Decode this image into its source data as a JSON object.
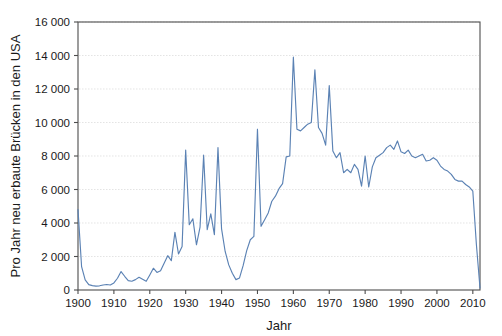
{
  "chart_data": {
    "type": "line",
    "title": "",
    "xlabel": "Jahr",
    "ylabel": "Pro Jahr neu erbaute Brücken in den USA",
    "xlim": [
      1900,
      2012
    ],
    "ylim": [
      0,
      16000
    ],
    "grid": true,
    "legend": "none",
    "line_color": "#5b82b4",
    "xticks": [
      "1900",
      "1910",
      "1920",
      "1930",
      "1940",
      "1950",
      "1960",
      "1970",
      "1980",
      "1990",
      "2000",
      "2010"
    ],
    "xtick_values": [
      1900,
      1910,
      1920,
      1930,
      1940,
      1950,
      1960,
      1970,
      1980,
      1990,
      2000,
      2010
    ],
    "yticks": [
      "0",
      "2 000",
      "4 000",
      "6 000",
      "8 000",
      "10 000",
      "12 000",
      "14 000",
      "16 000"
    ],
    "ytick_values": [
      0,
      2000,
      4000,
      6000,
      8000,
      10000,
      12000,
      14000,
      16000
    ],
    "series": [
      {
        "name": "Pro Jahr neu erbaute Brücken in den USA",
        "x": [
          1900,
          1901,
          1902,
          1903,
          1904,
          1905,
          1906,
          1907,
          1908,
          1909,
          1910,
          1911,
          1912,
          1913,
          1914,
          1915,
          1916,
          1917,
          1918,
          1919,
          1920,
          1921,
          1922,
          1923,
          1924,
          1925,
          1926,
          1927,
          1928,
          1929,
          1930,
          1931,
          1932,
          1933,
          1934,
          1935,
          1936,
          1937,
          1938,
          1939,
          1940,
          1941,
          1942,
          1943,
          1944,
          1945,
          1946,
          1947,
          1948,
          1949,
          1950,
          1951,
          1952,
          1953,
          1954,
          1955,
          1956,
          1957,
          1958,
          1959,
          1960,
          1961,
          1962,
          1963,
          1964,
          1965,
          1966,
          1967,
          1968,
          1969,
          1970,
          1971,
          1972,
          1973,
          1974,
          1975,
          1976,
          1977,
          1978,
          1979,
          1980,
          1981,
          1982,
          1983,
          1984,
          1985,
          1986,
          1987,
          1988,
          1989,
          1990,
          1991,
          1992,
          1993,
          1994,
          1995,
          1996,
          1997,
          1998,
          1999,
          2000,
          2001,
          2002,
          2003,
          2004,
          2005,
          2006,
          2007,
          2008,
          2009,
          2010,
          2011,
          2012
        ],
        "values": [
          4800,
          1400,
          600,
          320,
          260,
          230,
          250,
          300,
          330,
          300,
          420,
          700,
          1100,
          820,
          560,
          520,
          620,
          760,
          640,
          520,
          900,
          1300,
          1050,
          1150,
          1600,
          2050,
          1750,
          3450,
          2150,
          2600,
          8350,
          3900,
          4250,
          2700,
          3750,
          8050,
          3600,
          4550,
          3300,
          8500,
          3650,
          2300,
          1500,
          1000,
          620,
          720,
          1450,
          2350,
          3000,
          3200,
          9600,
          3800,
          4200,
          4600,
          5300,
          5600,
          6050,
          6350,
          7950,
          8000,
          13900,
          9600,
          9500,
          9700,
          9900,
          10000,
          13150,
          9700,
          9350,
          8650,
          12200,
          8300,
          7900,
          8200,
          7000,
          7200,
          7000,
          7500,
          7200,
          6200,
          8000,
          6150,
          7350,
          7900,
          8050,
          8200,
          8500,
          8650,
          8400,
          8900,
          8250,
          8150,
          8350,
          8000,
          7900,
          8000,
          8100,
          7700,
          7750,
          7900,
          7750,
          7400,
          7200,
          7100,
          6900,
          6600,
          6500,
          6500,
          6300,
          6150,
          5900,
          2700,
          120
        ]
      }
    ]
  }
}
